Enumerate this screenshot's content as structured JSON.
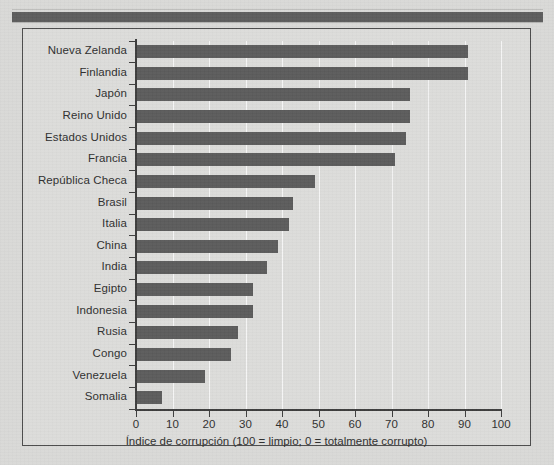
{
  "figure": {
    "top_rule": "decorative-rule"
  },
  "chart_data": {
    "type": "bar",
    "orientation": "horizontal",
    "title": "",
    "subtitle": "",
    "xlabel": "Índice de corrupción (100 = limpio; 0 = totalmente corrupto)",
    "ylabel": "",
    "xlim": [
      0,
      100
    ],
    "xticks": [
      0,
      10,
      20,
      30,
      40,
      50,
      60,
      70,
      80,
      90,
      100
    ],
    "xtick_labels": [
      "0",
      "10",
      "20",
      "30",
      "40",
      "50",
      "60",
      "70",
      "80",
      "90",
      "100"
    ],
    "grid": "vertical",
    "legend": "none",
    "bar_color": "#5b5b5b",
    "background_color": "#dcdcda",
    "categories": [
      "Nueva Zelanda",
      "Finlandia",
      "Japón",
      "Reino Unido",
      "Estados Unidos",
      "Francia",
      "República Checa",
      "Brasil",
      "Italia",
      "China",
      "India",
      "Egipto",
      "Indonesia",
      "Rusia",
      "Congo",
      "Venezuela",
      "Somalia"
    ],
    "values": [
      91,
      91,
      75,
      75,
      74,
      71,
      49,
      43,
      42,
      39,
      36,
      32,
      32,
      28,
      26,
      19,
      7
    ]
  }
}
